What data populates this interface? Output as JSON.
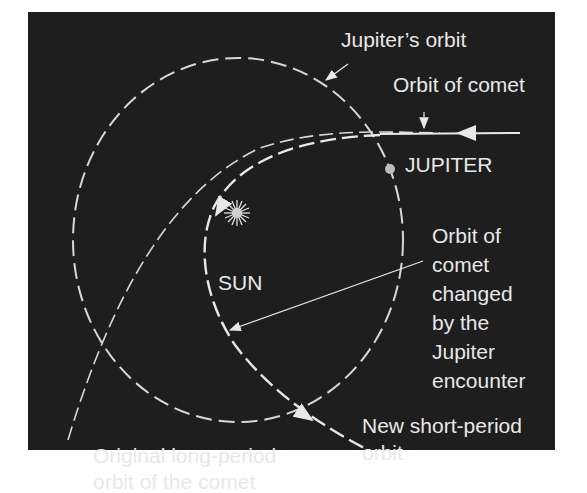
{
  "diagram": {
    "labels": {
      "jupiter_orbit": "Jupiter’s orbit",
      "orbit_of_comet": "Orbit of comet",
      "jupiter": "JUPITER",
      "sun": "SUN",
      "changed_orbit_line1": "Orbit of",
      "changed_orbit_line2": "comet",
      "changed_orbit_line3": "changed",
      "changed_orbit_line4": "by the",
      "changed_orbit_line5": "Jupiter",
      "changed_orbit_line6": "encounter",
      "new_orbit_line1": "New short-period",
      "new_orbit_line2": "orbit",
      "original_orbit_line1": "Original long-period",
      "original_orbit_line2": "orbit of the comet"
    },
    "colors": {
      "background": "#1e1e1e",
      "foreground": "#e8e8e8"
    }
  }
}
